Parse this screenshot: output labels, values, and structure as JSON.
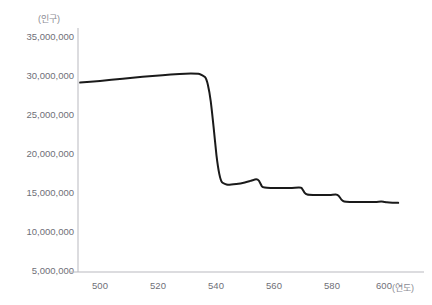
{
  "title": "고구려 인구 변화 추이",
  "axes": {
    "y_unit": "(인구)",
    "x_unit": "(연도)",
    "y_ticks": [
      "35,000,000",
      "30,000,000",
      "25,000,000",
      "20,000,000",
      "15,000,000",
      "10,000,000",
      "5,000,000"
    ],
    "x_ticks": [
      "500",
      "520",
      "540",
      "560",
      "580",
      "600"
    ]
  },
  "colors": {
    "line": "#1a1a1a",
    "axis": "#b9b9bf",
    "tick_text": "#6f6f77",
    "unit_text": "#8b8b93",
    "background": "#ffffff"
  },
  "chart_data": {
    "type": "line",
    "title": "고구려 인구 변화 추이",
    "xlabel": "(연도)",
    "ylabel": "(인구)",
    "xlim": [
      493,
      607
    ],
    "ylim": [
      5000000,
      35000000
    ],
    "grid": false,
    "legend": "none",
    "series": [
      {
        "name": "인구",
        "x": [
          493,
          500,
          508,
          515,
          522,
          528,
          532,
          535,
          537,
          538,
          539,
          540,
          541,
          542,
          543,
          545,
          548,
          551,
          553,
          555,
          556,
          557,
          558,
          560,
          563,
          567,
          570,
          571,
          572,
          573,
          575,
          578,
          581,
          583,
          584,
          585,
          586,
          588,
          591,
          594,
          597,
          599,
          600,
          601,
          603,
          605
        ],
        "y": [
          28900000,
          29100000,
          29400000,
          29650000,
          29850000,
          30000000,
          30050000,
          30000000,
          29600000,
          28600000,
          26500000,
          23200000,
          19600000,
          17200000,
          16100000,
          15800000,
          15900000,
          16100000,
          16300000,
          16500000,
          16300000,
          15600000,
          15450000,
          15400000,
          15400000,
          15400000,
          15450000,
          15400000,
          14800000,
          14550000,
          14500000,
          14500000,
          14500000,
          14550000,
          14400000,
          13900000,
          13650000,
          13600000,
          13600000,
          13600000,
          13600000,
          13650000,
          13600000,
          13550000,
          13500000,
          13480000
        ]
      }
    ],
    "annotations": [
      "peak around year 535 at about 30,000,000",
      "sharp collapse between 537 and 545 down to about 15,800,000",
      "descending staircase from 555 to 605 with small rebounds before each drop"
    ]
  }
}
